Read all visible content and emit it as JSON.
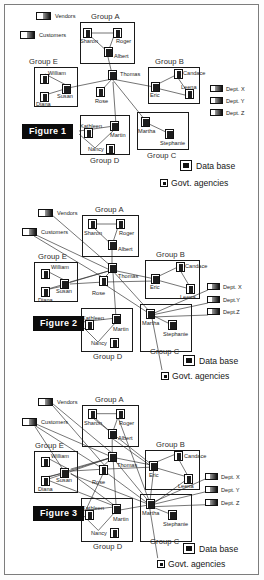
{
  "figures": [
    {
      "caption": "Figure 1",
      "groups": [
        {
          "name": "Group A"
        },
        {
          "name": "Group B"
        },
        {
          "name": "Group C"
        },
        {
          "name": "Group D"
        },
        {
          "name": "Group E"
        }
      ],
      "people": [
        {
          "name": "Sharon",
          "group": "Group A"
        },
        {
          "name": "Roger",
          "group": "Group A"
        },
        {
          "name": "Albert",
          "group": "Group A"
        },
        {
          "name": "Thomas",
          "group": "hub"
        },
        {
          "name": "Rose",
          "group": "hub"
        },
        {
          "name": "Eric",
          "group": "Group B"
        },
        {
          "name": "Candace",
          "group": "Group B"
        },
        {
          "name": "Leena",
          "group": "Group B"
        },
        {
          "name": "Martha",
          "group": "Group C"
        },
        {
          "name": "Stephanie",
          "group": "Group C"
        },
        {
          "name": "Kathleen",
          "group": "Group D"
        },
        {
          "name": "Martin",
          "group": "Group D"
        },
        {
          "name": "Nancy",
          "group": "Group D"
        },
        {
          "name": "William",
          "group": "Group E"
        },
        {
          "name": "Susan",
          "group": "Group E"
        },
        {
          "name": "Diana",
          "group": "Group E"
        }
      ],
      "legend": {
        "vendors": "Vendors",
        "customers": "Customers",
        "dept_x": "Dept. X",
        "dept_y": "Dept. Y",
        "dept_z": "Dept. Z",
        "database": "Data base",
        "govt": "Govt. agencies"
      }
    },
    {
      "caption": "Figure 2",
      "groups": [
        {
          "name": "Group A"
        },
        {
          "name": "Group B"
        },
        {
          "name": "Group C"
        },
        {
          "name": "Group D"
        },
        {
          "name": "Group E"
        }
      ],
      "people": [
        {
          "name": "Sharon",
          "group": "Group A"
        },
        {
          "name": "Roger",
          "group": "Group A"
        },
        {
          "name": "Albert",
          "group": "Group A"
        },
        {
          "name": "Thomas",
          "group": "hub"
        },
        {
          "name": "Rose",
          "group": "hub"
        },
        {
          "name": "Eric",
          "group": "Group B"
        },
        {
          "name": "Candace",
          "group": "Group B"
        },
        {
          "name": "Leena",
          "group": "Group B"
        },
        {
          "name": "Martha",
          "group": "Group C"
        },
        {
          "name": "Stephanie",
          "group": "Group C"
        },
        {
          "name": "Kathleen",
          "group": "Group D"
        },
        {
          "name": "Martin",
          "group": "Group D"
        },
        {
          "name": "Nancy",
          "group": "Group D"
        },
        {
          "name": "William",
          "group": "Group E"
        },
        {
          "name": "Susan",
          "group": "Group E"
        },
        {
          "name": "Diana",
          "group": "Group E"
        }
      ],
      "legend": {
        "vendors": "Vendors",
        "customers": "Customers",
        "dept_x": "Dept. X",
        "dept_y": "Dept.Y",
        "dept_z": "Dept.Z",
        "database": "Data base",
        "govt": "Govt. agencies"
      }
    },
    {
      "caption": "Figure 3",
      "groups": [
        {
          "name": "Group A"
        },
        {
          "name": "Group B"
        },
        {
          "name": "Group C"
        },
        {
          "name": "Group D"
        },
        {
          "name": "Group E"
        }
      ],
      "people": [
        {
          "name": "Sharon",
          "group": "Group A"
        },
        {
          "name": "Roger",
          "group": "Group A"
        },
        {
          "name": "Albert",
          "group": "Group A"
        },
        {
          "name": "Thomas",
          "group": "hub"
        },
        {
          "name": "Rose",
          "group": "hub"
        },
        {
          "name": "Eric",
          "group": "Group B"
        },
        {
          "name": "Candace",
          "group": "Group B"
        },
        {
          "name": "Leena",
          "group": "Group B"
        },
        {
          "name": "Martha",
          "group": "Group C"
        },
        {
          "name": "Stephanie",
          "group": "Group C"
        },
        {
          "name": "Kathleen",
          "group": "Group D"
        },
        {
          "name": "Martin",
          "group": "Group D"
        },
        {
          "name": "Nancy",
          "group": "Group D"
        },
        {
          "name": "William",
          "group": "Group E"
        },
        {
          "name": "Susan",
          "group": "Group E"
        },
        {
          "name": "Diana",
          "group": "Group E"
        }
      ],
      "legend": {
        "vendors": "Vendors",
        "customers": "Customers",
        "dept_x": "Dept. X",
        "dept_y": "Dept. Y",
        "dept_z": "Dept. Z",
        "database": "Data base",
        "govt": "Govt. agencies"
      }
    }
  ],
  "colors": {
    "ink": "#1a1a1a",
    "frame": "#7d7d7d",
    "chip_bg": "#0b0b0b",
    "chip_fg": "#ffffff",
    "edge": "#2a2a2a"
  }
}
